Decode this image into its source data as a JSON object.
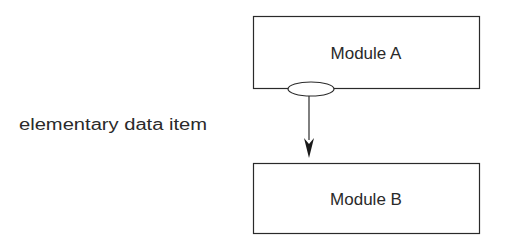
{
  "diagram": {
    "module_a": {
      "label": "Module A"
    },
    "module_b": {
      "label": "Module B"
    },
    "connector": {
      "label": "elementary data item",
      "symbol": "ellipse",
      "direction": "A-to-B"
    }
  },
  "colors": {
    "stroke": "#2a2a2a",
    "background": "#ffffff"
  }
}
